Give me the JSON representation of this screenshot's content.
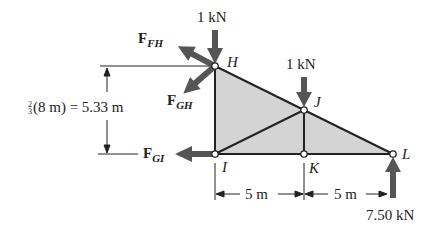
{
  "diagram": {
    "type": "truss free-body diagram",
    "nodes": {
      "H": {
        "label": "H"
      },
      "I": {
        "label": "I"
      },
      "J": {
        "label": "J"
      },
      "K": {
        "label": "K"
      },
      "L": {
        "label": "L"
      }
    },
    "loads": {
      "load_H": "1 kN",
      "load_J": "1 kN",
      "reaction_L": "7.50 kN"
    },
    "member_forces": {
      "FH": {
        "base": "F",
        "sub": "FH"
      },
      "GH": {
        "base": "F",
        "sub": "GH"
      },
      "GI": {
        "base": "F",
        "sub": "GI"
      }
    },
    "dimensions": {
      "height_frac_num": "2",
      "height_frac_den": "3",
      "height_text": "(8 m) = 5.33 m",
      "span_IK": "5 m",
      "span_KL": "5 m"
    },
    "colors": {
      "fill": "#d4d4d4",
      "member": "#222222",
      "arrow": "#555555"
    }
  }
}
